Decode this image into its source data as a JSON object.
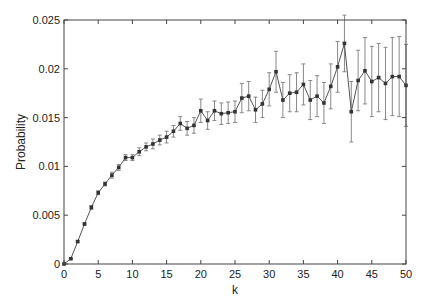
{
  "chart_data": {
    "type": "line",
    "title": "",
    "xlabel": "k",
    "ylabel": "Probability",
    "xlim": [
      0,
      50
    ],
    "ylim": [
      0,
      0.025
    ],
    "xticks": [
      0,
      5,
      10,
      15,
      20,
      25,
      30,
      35,
      40,
      45,
      50
    ],
    "xtick_labels": [
      "0",
      "5",
      "10",
      "15",
      "20",
      "25",
      "30",
      "35",
      "40",
      "45",
      "50"
    ],
    "yticks": [
      0,
      0.005,
      0.01,
      0.015,
      0.02,
      0.025
    ],
    "ytick_labels": [
      "0",
      "0.005",
      "0.01",
      "0.015",
      "0.02",
      "0.025"
    ],
    "grid": false,
    "legend": null,
    "line_color": "#555555",
    "marker": "square",
    "error_bars": true,
    "series": [
      {
        "name": "Probability",
        "x": [
          0,
          1,
          2,
          3,
          4,
          5,
          6,
          7,
          8,
          9,
          10,
          11,
          12,
          13,
          14,
          15,
          16,
          17,
          18,
          19,
          20,
          21,
          22,
          23,
          24,
          25,
          26,
          27,
          28,
          29,
          30,
          31,
          32,
          33,
          34,
          35,
          36,
          37,
          38,
          39,
          40,
          41,
          42,
          43,
          44,
          45,
          46,
          47,
          48,
          49,
          50
        ],
        "y": [
          0,
          0.00054,
          0.0023,
          0.0041,
          0.0058,
          0.0073,
          0.0082,
          0.0091,
          0.0099,
          0.0109,
          0.0109,
          0.0115,
          0.012,
          0.0123,
          0.0127,
          0.013,
          0.0136,
          0.0144,
          0.0139,
          0.0142,
          0.0157,
          0.0147,
          0.0157,
          0.0154,
          0.0155,
          0.0156,
          0.017,
          0.0172,
          0.0158,
          0.0164,
          0.0179,
          0.0197,
          0.0168,
          0.0175,
          0.0176,
          0.0184,
          0.0168,
          0.0172,
          0.0165,
          0.0182,
          0.0202,
          0.0226,
          0.0156,
          0.0188,
          0.0198,
          0.0187,
          0.0191,
          0.0185,
          0.0192,
          0.0192,
          0.0183
        ],
        "err": [
          0,
          5e-05,
          0.0001,
          0.0001,
          0.0002,
          0.0002,
          0.0002,
          0.0003,
          0.0003,
          0.0003,
          0.0003,
          0.0004,
          0.0004,
          0.0005,
          0.0005,
          0.0006,
          0.0006,
          0.0007,
          0.0007,
          0.0008,
          0.0012,
          0.0009,
          0.001,
          0.0011,
          0.0011,
          0.0011,
          0.0015,
          0.0015,
          0.0013,
          0.0014,
          0.0017,
          0.0021,
          0.0018,
          0.0019,
          0.002,
          0.0021,
          0.002,
          0.0021,
          0.0021,
          0.0023,
          0.0026,
          0.0029,
          0.0031,
          0.0031,
          0.0034,
          0.0036,
          0.0035,
          0.0037,
          0.004,
          0.0041,
          0.0042
        ]
      }
    ]
  }
}
